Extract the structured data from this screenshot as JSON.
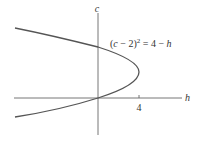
{
  "diagram": {
    "type": "parabola graph",
    "equation_parts": {
      "lhs_open": "(",
      "var_c": "c",
      "minus_two": " − 2)",
      "exp": "2",
      "rhs": " = 4 − ",
      "var_h": "h"
    },
    "equation": "(c − 2)^2 = 4 − h",
    "x_axis_label": "h",
    "y_axis_label": "c",
    "x_tick_label": "4",
    "vertex": [
      4,
      2
    ],
    "intercepts": {
      "c": [
        0,
        4
      ],
      "h": 0
    },
    "colors": {
      "curve": "#555555",
      "axes": "#666666",
      "text": "#333333"
    }
  }
}
